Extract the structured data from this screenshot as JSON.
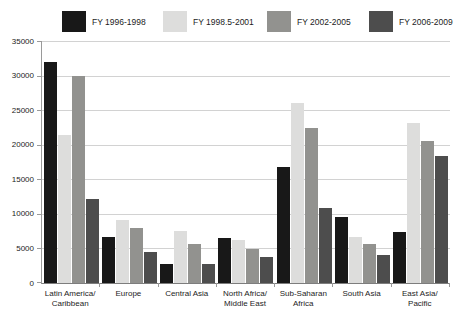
{
  "colors": {
    "series_black": "#181818",
    "series_light_gray": "#dddddc",
    "series_medium_gray": "#92928f",
    "series_dark_gray": "#4d4d4d",
    "gridline": "#d2d2d2",
    "axis": "#9a9a9a",
    "text": "#1c1c1c",
    "background": "#ffffff"
  },
  "chart_data": {
    "type": "bar",
    "title": "",
    "categories": [
      "Latin America/\nCaribbean",
      "Europe",
      "Central Asia",
      "North Africa/\nMiddle East",
      "Sub-Saharan\nAfrica",
      "South Asia",
      "East Asia/\nPacific"
    ],
    "series": [
      {
        "name": "FY 1996-1998",
        "color": "#181818",
        "values": [
          32000,
          6700,
          2800,
          6500,
          16800,
          9600,
          7400
        ]
      },
      {
        "name": "FY 1998.5-2001",
        "color": "#dddddc",
        "values": [
          21400,
          9100,
          7500,
          6200,
          26000,
          6600,
          23200
        ]
      },
      {
        "name": "FY 2002-2005",
        "color": "#92928f",
        "values": [
          30000,
          7900,
          5600,
          4900,
          22400,
          5600,
          20500
        ]
      },
      {
        "name": "FY 2006-2009",
        "color": "#4d4d4d",
        "values": [
          12100,
          4500,
          2800,
          3800,
          10800,
          4000,
          18300
        ]
      }
    ],
    "xlabel": "",
    "ylabel": "",
    "ylim": [
      0,
      35000
    ],
    "yticks": [
      0,
      5000,
      10000,
      15000,
      20000,
      25000,
      30000,
      35000
    ],
    "grid": true,
    "legend_position": "top",
    "legend_item_lefts_px": [
      62,
      163,
      267,
      369
    ]
  }
}
